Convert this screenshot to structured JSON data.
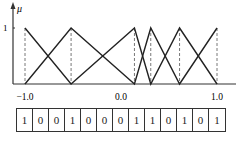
{
  "chart_data": {
    "type": "line",
    "title": "",
    "ylabel": "μ",
    "xlabel": "",
    "y_tick_labels": [
      "1"
    ],
    "x_tick_labels": [
      {
        "value": -1.0,
        "label": "-1.0"
      },
      {
        "value": 0.0,
        "label": "0.0"
      },
      {
        "value": 1.0,
        "label": "1.0"
      }
    ],
    "xlim": [
      -1.0,
      1.0
    ],
    "ylim": [
      0,
      1
    ],
    "breakpoints": [
      -1.0,
      -0.52,
      0.14,
      0.31,
      0.61,
      1.0
    ],
    "series": [
      {
        "name": "falling/rising set A",
        "x": [
          -1.0,
          -0.52,
          0.14,
          0.31,
          0.61,
          1.0
        ],
        "y": [
          1,
          0,
          1,
          0,
          1,
          0
        ]
      },
      {
        "name": "falling/rising set B",
        "x": [
          -1.0,
          -0.52,
          0.14,
          0.31,
          0.61,
          1.0
        ],
        "y": [
          0,
          1,
          0,
          1,
          0,
          1
        ]
      }
    ],
    "dashed_verticals_at": [
      -1.0,
      -0.52,
      0.14,
      0.31,
      0.61,
      1.0
    ]
  },
  "bit_string": {
    "bits": [
      "1",
      "0",
      "0",
      "1",
      "0",
      "0",
      "0",
      "1",
      "1",
      "0",
      "1",
      "0",
      "1"
    ]
  }
}
